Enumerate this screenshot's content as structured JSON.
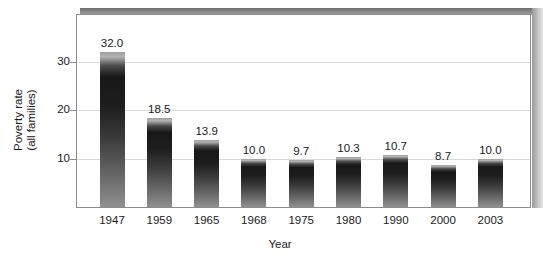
{
  "chart_data": {
    "type": "bar",
    "title": "",
    "subtitle": "",
    "xlabel": "Year",
    "ylabel": "Poverty rate\n(all families)",
    "ylabel_line1": "Poverty rate",
    "ylabel_line2": "(all families)",
    "categories": [
      "1947",
      "1959",
      "1965",
      "1968",
      "1975",
      "1980",
      "1990",
      "2000",
      "2003"
    ],
    "values": [
      32.0,
      18.5,
      13.9,
      10.0,
      9.7,
      10.3,
      10.7,
      8.7,
      10.0
    ],
    "value_labels": [
      "32.0",
      "18.5",
      "13.9",
      "10.0",
      "9.7",
      "10.3",
      "10.7",
      "8.7",
      "10.0"
    ],
    "ylim": [
      0,
      38
    ],
    "yticks": [
      10,
      20,
      30
    ],
    "ytick_labels": [
      "10",
      "20",
      "30"
    ],
    "grid": "horizontal",
    "legend": "none",
    "series": [
      {
        "name": "Poverty rate (all families)",
        "values": [
          32.0,
          18.5,
          13.9,
          10.0,
          9.7,
          10.3,
          10.7,
          8.7,
          10.0
        ]
      }
    ],
    "bar_color_top": "#181818",
    "bar_color_bottom": "#8f8f8f",
    "gridline_color": "#d9d9d9",
    "frame_color": "#8c8c8c",
    "shadow_color": "#8a8a8a",
    "background_color": "#ffffff",
    "text_color": "#1a1a1a"
  }
}
